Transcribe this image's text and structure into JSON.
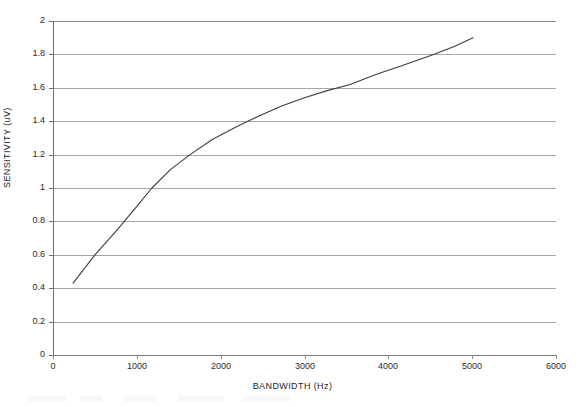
{
  "chart_data": {
    "type": "line",
    "title": "",
    "xlabel": "BANDWIDTH (Hz)",
    "ylabel": "SENSITIVITY (uV)",
    "xlim": [
      0,
      6000
    ],
    "ylim": [
      0,
      2
    ],
    "x_ticks": [
      0,
      1000,
      2000,
      3000,
      4000,
      5000,
      6000
    ],
    "x_tick_labels": [
      "0",
      "1000",
      "2000",
      "3000",
      "4000",
      "5000",
      "6000"
    ],
    "y_ticks": [
      0,
      0.2,
      0.4,
      0.6,
      0.8,
      1,
      1.2,
      1.4,
      1.6,
      1.8,
      2
    ],
    "y_tick_labels": [
      "0",
      "0.2",
      "0.4",
      "0.6",
      "0.8",
      "1",
      "1.2",
      "1.4",
      "1.6",
      "1.8",
      "2"
    ],
    "grid": "horizontal",
    "legend": "none",
    "series": [
      {
        "name": "sensitivity",
        "color": "#3d3d3d",
        "line_width": 1.1,
        "x": [
          240,
          500,
          750,
          1000,
          1180,
          1400,
          1635,
          1900,
          2200,
          2450,
          2720,
          3000,
          3250,
          3545,
          3850,
          4150,
          4540,
          4800,
          5010
        ],
        "y": [
          0.43,
          0.6,
          0.74,
          0.89,
          1.0,
          1.11,
          1.2,
          1.29,
          1.37,
          1.43,
          1.49,
          1.54,
          1.58,
          1.62,
          1.68,
          1.73,
          1.8,
          1.85,
          1.9
        ]
      }
    ]
  },
  "axes": {
    "x_title": "BANDWIDTH (Hz)",
    "y_title": "SENSITIVITY (uV)"
  }
}
